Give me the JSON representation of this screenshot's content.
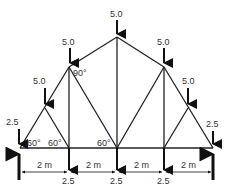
{
  "diagram": {
    "type": "roof truss",
    "loads_top": [
      {
        "label": "5.0",
        "node": "N_top_left_low"
      },
      {
        "label": "5.0",
        "node": "N_top_left_high"
      },
      {
        "label": "5.0",
        "node": "N_apex"
      },
      {
        "label": "5.0",
        "node": "N_top_right_high"
      },
      {
        "label": "5.0",
        "node": "N_top_right_low"
      }
    ],
    "end_loads": [
      {
        "label": "2.5",
        "side": "left"
      },
      {
        "label": "2.5",
        "side": "right"
      }
    ],
    "bottom_loads": [
      {
        "label": "2.5"
      },
      {
        "label": "2.5"
      },
      {
        "label": "2.5"
      }
    ],
    "angles": [
      {
        "label": "90°"
      },
      {
        "label": "60°"
      },
      {
        "label": "60°"
      },
      {
        "label": "60°"
      }
    ],
    "spans": [
      {
        "label": "2 m"
      },
      {
        "label": "2 m"
      },
      {
        "label": "2 m"
      },
      {
        "label": "2 m"
      }
    ]
  }
}
